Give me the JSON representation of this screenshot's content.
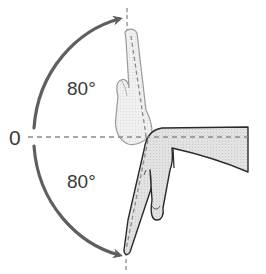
{
  "diagram": {
    "type": "range-of-motion",
    "labels": {
      "zero": "0",
      "upper_angle": "80°",
      "lower_angle": "80°"
    },
    "colors": {
      "arrow": "#5f5f5f",
      "dash": "#8a8a8a",
      "hand_fill_active": "#d4d4d4",
      "hand_fill_ghost": "#ebebeb",
      "outline": "#2a2a2a",
      "text": "#3a3a3a"
    }
  }
}
